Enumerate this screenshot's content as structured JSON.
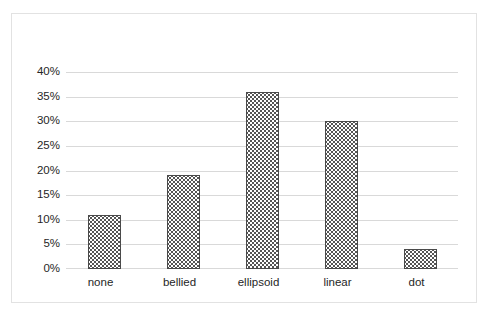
{
  "chart_data": {
    "type": "bar",
    "title": "",
    "subtitle": "",
    "xlabel": "",
    "ylabel": "",
    "categories": [
      "none",
      "bellied",
      "ellipsoid",
      "linear",
      "dot"
    ],
    "values": [
      11,
      19,
      36,
      30,
      4
    ],
    "value_suffix": "%",
    "ylim": [
      0,
      40
    ],
    "ytick_labels": [
      "40%",
      "35%",
      "30%",
      "25%",
      "20%",
      "15%",
      "10%",
      "5%",
      "0%"
    ],
    "ytick_values": [
      40,
      35,
      30,
      25,
      20,
      15,
      10,
      5,
      0
    ],
    "grid": true,
    "grid_axis": "y",
    "legend": false,
    "legend_position": "none",
    "series": [
      {
        "name": "",
        "values": [
          11,
          19,
          36,
          30,
          4
        ]
      }
    ],
    "colors": {
      "bar_fill": "#ffffff",
      "bar_pattern": "#555555",
      "bar_border": "#4a4a4a",
      "gridline": "#d9d9d9",
      "frame_border": "#e2e2e2",
      "text": "#262626",
      "background": "#ffffff"
    }
  }
}
